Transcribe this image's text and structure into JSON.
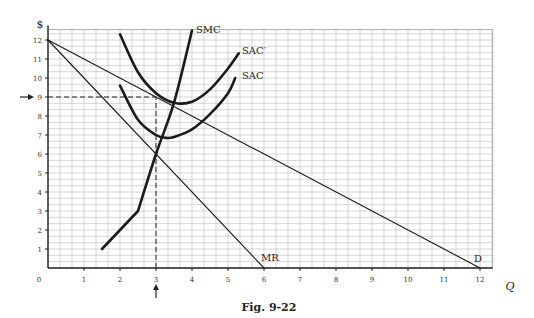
{
  "figure": {
    "caption": "Fig. 9-22",
    "y_axis_title": "$",
    "x_axis_title": "Q",
    "origin_label": "0"
  },
  "chart_data": {
    "type": "line",
    "title": "Fig. 9-22",
    "xlabel": "Q",
    "ylabel": "$",
    "xlim": [
      0,
      12.5
    ],
    "ylim": [
      0,
      12.5
    ],
    "grid": true,
    "grid_minor_step": 0.3333,
    "x_ticks": [
      1,
      2,
      3,
      4,
      5,
      6,
      7,
      8,
      9,
      10,
      11,
      12
    ],
    "y_ticks": [
      1,
      2,
      3,
      4,
      5,
      6,
      7,
      8,
      9,
      10,
      11,
      12
    ],
    "series": [
      {
        "name": "D",
        "style": "thin",
        "points": [
          [
            0,
            12
          ],
          [
            12,
            0
          ]
        ]
      },
      {
        "name": "MR",
        "style": "thin",
        "points": [
          [
            0,
            12
          ],
          [
            6,
            0
          ]
        ]
      },
      {
        "name": "SMC",
        "style": "thick",
        "points": [
          [
            1.5,
            1
          ],
          [
            2.5,
            3
          ],
          [
            3,
            6
          ],
          [
            3.5,
            8.7
          ],
          [
            4,
            12.5
          ]
        ]
      },
      {
        "name": "SAC",
        "style": "thick",
        "points": [
          [
            2,
            9.6
          ],
          [
            2.5,
            7.8
          ],
          [
            3,
            7
          ],
          [
            3.3,
            6.85
          ],
          [
            3.5,
            6.9
          ],
          [
            4,
            7.3
          ],
          [
            4.5,
            8.1
          ],
          [
            5,
            9.2
          ],
          [
            5.2,
            10
          ]
        ]
      },
      {
        "name": "SAC′",
        "style": "thick",
        "points": [
          [
            2,
            12.3
          ],
          [
            2.5,
            10.3
          ],
          [
            3,
            9.2
          ],
          [
            3.5,
            8.7
          ],
          [
            4,
            8.75
          ],
          [
            4.5,
            9.4
          ],
          [
            5,
            10.5
          ],
          [
            5.3,
            11.3
          ]
        ]
      }
    ],
    "annotations": [
      {
        "type": "dashed-line",
        "from": [
          0,
          9
        ],
        "to": [
          3,
          9
        ]
      },
      {
        "type": "dashed-line",
        "from": [
          3,
          0
        ],
        "to": [
          3,
          9
        ]
      },
      {
        "type": "arrow",
        "at": "y=9",
        "direction": "right"
      },
      {
        "type": "arrow",
        "at": "x=3",
        "direction": "up"
      }
    ],
    "labels": {
      "D": "D",
      "MR": "MR",
      "SMC": "SMC",
      "SAC": "SAC",
      "SACp": "SAC′"
    }
  }
}
